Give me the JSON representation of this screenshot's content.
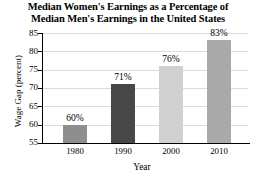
{
  "chart_data": {
    "type": "bar",
    "title": "Median Women's Earnings as a Percentage of Median Men's Earnings in the United States",
    "title_lines": [
      "Median Women's Earnings as a Percentage of",
      "Median Men's Earnings in the United States"
    ],
    "xlabel": "Year",
    "ylabel": "Wage Gap (percent)",
    "categories": [
      "1980",
      "1990",
      "2000",
      "2010"
    ],
    "values": [
      60,
      71,
      76,
      83
    ],
    "data_labels": [
      "60%",
      "71%",
      "76%",
      "83%"
    ],
    "ylim": [
      55,
      85
    ],
    "yticks": [
      55,
      60,
      65,
      70,
      75,
      80,
      85
    ],
    "ytick_labels": [
      "55",
      "60",
      "65",
      "70",
      "75",
      "80",
      "85"
    ],
    "grid": true,
    "legend": false,
    "bar_colors": [
      "#8e8e8e",
      "#474747",
      "#d0d0d0",
      "#a9a9a9"
    ],
    "grid_color": "#dcdcdc",
    "axis_color": "#000000",
    "background": "#ffffff"
  }
}
